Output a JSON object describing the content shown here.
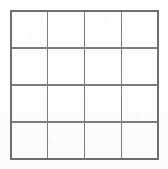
{
  "figure": {
    "title": "",
    "kind": "grid-diagram"
  },
  "grid": {
    "rows": 4,
    "columns": 4,
    "cell_count": 16,
    "origin_x": 11,
    "origin_y": 11,
    "width": 147,
    "height": 148,
    "cell_width": 36.75,
    "cell_height": 37,
    "x_positions": [
      11,
      47.75,
      84.5,
      121.25,
      158
    ],
    "y_positions": [
      11,
      48,
      85,
      122,
      159
    ],
    "line_color": "#7d7d7d",
    "border_color": "#6f6f6f",
    "line_width": 1.4,
    "border_width": 1.6,
    "cell_fill": "#ffffff",
    "background_color": "#fefefe",
    "cells": [
      {
        "row": 1,
        "col": 1,
        "label": ""
      },
      {
        "row": 1,
        "col": 2,
        "label": ""
      },
      {
        "row": 1,
        "col": 3,
        "label": ""
      },
      {
        "row": 1,
        "col": 4,
        "label": ""
      },
      {
        "row": 2,
        "col": 1,
        "label": ""
      },
      {
        "row": 2,
        "col": 2,
        "label": ""
      },
      {
        "row": 2,
        "col": 3,
        "label": ""
      },
      {
        "row": 2,
        "col": 4,
        "label": ""
      },
      {
        "row": 3,
        "col": 1,
        "label": ""
      },
      {
        "row": 3,
        "col": 2,
        "label": ""
      },
      {
        "row": 3,
        "col": 3,
        "label": ""
      },
      {
        "row": 3,
        "col": 4,
        "label": ""
      },
      {
        "row": 4,
        "col": 1,
        "label": ""
      },
      {
        "row": 4,
        "col": 2,
        "label": ""
      },
      {
        "row": 4,
        "col": 3,
        "label": ""
      },
      {
        "row": 4,
        "col": 4,
        "label": ""
      }
    ]
  }
}
